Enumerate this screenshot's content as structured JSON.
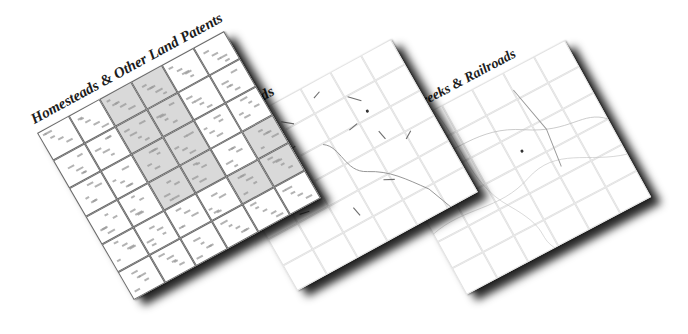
{
  "maps": [
    {
      "id": "homesteads",
      "title": "Homesteads & Other Land Patents",
      "shaded_cells": [
        2,
        3,
        8,
        9,
        14,
        15,
        20,
        21,
        23,
        28,
        29
      ]
    },
    {
      "id": "roads",
      "title": "Roads"
    },
    {
      "id": "waterways",
      "title": "Rivers, Creeks & Railroads"
    }
  ],
  "colors": {
    "background": "#ffffff",
    "grid_dark": "#6a6a6a",
    "grid_light": "#e2e2e2",
    "shade": "#d9d9d9",
    "title": "#1c1c1c"
  }
}
